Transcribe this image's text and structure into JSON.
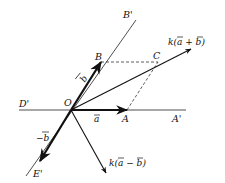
{
  "diagram": {
    "colors": {
      "ink": "#111111",
      "background": "#ffffff"
    },
    "origin": {
      "label": "O",
      "x": 71,
      "y": 110
    },
    "points": {
      "A": {
        "label": "A",
        "x": 127,
        "y": 110
      },
      "B": {
        "label": "B",
        "x": 101,
        "y": 62
      },
      "C": {
        "label": "C",
        "x": 158,
        "y": 62
      }
    },
    "lines": {
      "horizontal": {
        "from_label": "D'",
        "to_label": "A'",
        "x1": 19,
        "y1": 110,
        "x2": 186,
        "y2": 110
      },
      "oblique": {
        "from_label": "E'",
        "to_label": "B'",
        "x1": 26,
        "y1": 176,
        "x2": 136,
        "y2": 20
      }
    },
    "vectors": {
      "a": {
        "label": "a",
        "tip_x": 127,
        "tip_y": 110
      },
      "b": {
        "label": "b",
        "tip_x": 101,
        "tip_y": 62
      },
      "neg_b": {
        "label": "−b",
        "tip_x": 40,
        "tip_y": 161
      },
      "k_sum": {
        "label": "k(a + b)",
        "tip_x": 191,
        "tip_y": 49
      },
      "k_diff": {
        "label": "k(a − b)",
        "tip_x": 106,
        "tip_y": 173
      }
    },
    "labels": {
      "B_prime": "B'",
      "B": "B",
      "C": "C",
      "O": "O",
      "D_prime": "D'",
      "A": "A",
      "A_prime": "A'",
      "E_prime": "E'",
      "b": "b",
      "neg_b": "−b",
      "a": "a",
      "k_sum_prefix": "k(",
      "k_sum_a": "a",
      "k_sum_op": " + ",
      "k_sum_b": "b",
      "k_sum_suffix": ")",
      "k_diff_prefix": "k(",
      "k_diff_a": "a",
      "k_diff_op": " − ",
      "k_diff_b": "b",
      "k_diff_suffix": ")"
    }
  }
}
